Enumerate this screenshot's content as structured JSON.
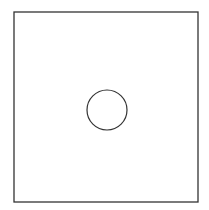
{
  "diagram": {
    "shapes": [
      {
        "type": "rect",
        "x": 14,
        "y": 12,
        "width": 184,
        "height": 190,
        "stroke": "#333333"
      },
      {
        "type": "circle",
        "cx": 107,
        "cy": 110,
        "r": 20,
        "stroke": "#333333"
      }
    ]
  }
}
